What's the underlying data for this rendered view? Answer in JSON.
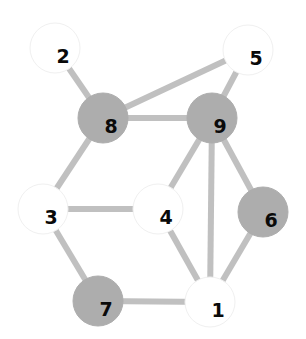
{
  "diagram": {
    "type": "node-link-graph",
    "width": 306,
    "height": 339,
    "background_color": "#ffffff",
    "node_radius": 25,
    "edge_color": "#c0c0c0",
    "edge_width": 6,
    "fill_colors": {
      "white": "#ffffff",
      "gray": "#adadad"
    },
    "stroke_colors": {
      "white": "#f0f0f0",
      "gray": "#adadad"
    },
    "label_color": "#0a0a0a",
    "nodes": [
      {
        "id": "1",
        "label": "1",
        "cx": 210,
        "cy": 302,
        "fill": "white",
        "label_dx": 8,
        "label_dy": 9
      },
      {
        "id": "2",
        "label": "2",
        "cx": 55,
        "cy": 48,
        "fill": "white",
        "label_dx": 8,
        "label_dy": 9
      },
      {
        "id": "3",
        "label": "3",
        "cx": 43,
        "cy": 209,
        "fill": "white",
        "label_dx": 8,
        "label_dy": 9
      },
      {
        "id": "4",
        "label": "4",
        "cx": 158,
        "cy": 209,
        "fill": "white",
        "label_dx": 8,
        "label_dy": 9
      },
      {
        "id": "5",
        "label": "5",
        "cx": 248,
        "cy": 50,
        "fill": "white",
        "label_dx": 8,
        "label_dy": 9
      },
      {
        "id": "6",
        "label": "6",
        "cx": 263,
        "cy": 212,
        "fill": "gray",
        "label_dx": 8,
        "label_dy": 9
      },
      {
        "id": "7",
        "label": "7",
        "cx": 98,
        "cy": 301,
        "fill": "gray",
        "label_dx": 8,
        "label_dy": 9
      },
      {
        "id": "8",
        "label": "8",
        "cx": 103,
        "cy": 118,
        "fill": "gray",
        "label_dx": 8,
        "label_dy": 9
      },
      {
        "id": "9",
        "label": "9",
        "cx": 212,
        "cy": 118,
        "fill": "gray",
        "label_dx": 8,
        "label_dy": 9
      }
    ],
    "edges": [
      {
        "source": "2",
        "target": "8"
      },
      {
        "source": "8",
        "target": "5"
      },
      {
        "source": "8",
        "target": "9"
      },
      {
        "source": "8",
        "target": "3"
      },
      {
        "source": "5",
        "target": "9"
      },
      {
        "source": "9",
        "target": "4"
      },
      {
        "source": "9",
        "target": "6"
      },
      {
        "source": "9",
        "target": "1"
      },
      {
        "source": "3",
        "target": "4"
      },
      {
        "source": "3",
        "target": "7"
      },
      {
        "source": "4",
        "target": "1"
      },
      {
        "source": "6",
        "target": "1"
      },
      {
        "source": "7",
        "target": "1"
      }
    ]
  }
}
